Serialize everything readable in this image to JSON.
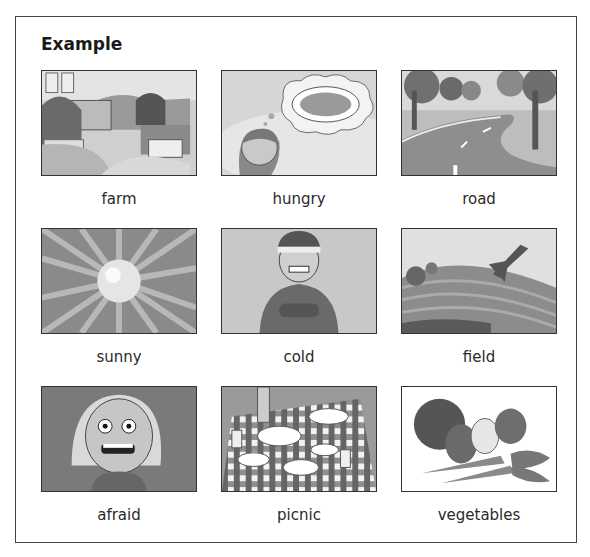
{
  "heading": "Example",
  "cards": [
    {
      "label": "farm",
      "icon": "farm-picture"
    },
    {
      "label": "hungry",
      "icon": "hungry-girl-picture"
    },
    {
      "label": "road",
      "icon": "road-picture"
    },
    {
      "label": "sunny",
      "icon": "sun-picture"
    },
    {
      "label": "cold",
      "icon": "cold-boy-picture"
    },
    {
      "label": "field",
      "icon": "field-picture"
    },
    {
      "label": "afraid",
      "icon": "afraid-girl-picture"
    },
    {
      "label": "picnic",
      "icon": "picnic-picture"
    },
    {
      "label": "vegetables",
      "icon": "vegetables-picture"
    }
  ]
}
